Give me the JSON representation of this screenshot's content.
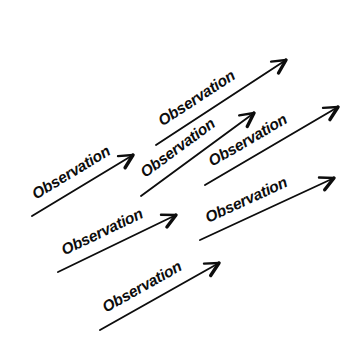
{
  "figure": {
    "background_color": "#ffffff",
    "ink_color": "#0d0d0d",
    "label_text": "Observation",
    "arrow_count": 7,
    "arrow_angle_degrees": -22
  },
  "arrows": [
    {
      "id": "arrow-1",
      "label": "Observation",
      "row": "upper",
      "order": 1,
      "x1": 32,
      "y1": 216,
      "x2": 133,
      "y2": 155,
      "label_font_size": 15.5,
      "label_offset": 12
    },
    {
      "id": "arrow-2",
      "label": "Observation",
      "row": "upper",
      "order": 2,
      "x1": 156,
      "y1": 145,
      "x2": 286,
      "y2": 60,
      "label_font_size": 15.5,
      "label_offset": 12
    },
    {
      "id": "arrow-3",
      "label": "Observation",
      "row": "middle",
      "order": 3,
      "x1": 141,
      "y1": 196,
      "x2": 254,
      "y2": 113,
      "label_font_size": 15.5,
      "label_offset": 12
    },
    {
      "id": "arrow-4",
      "label": "Observation",
      "row": "middle",
      "order": 4,
      "x1": 205,
      "y1": 185,
      "x2": 338,
      "y2": 107,
      "label_font_size": 15.5,
      "label_offset": 12
    },
    {
      "id": "arrow-5",
      "label": "Observation",
      "row": "lower",
      "order": 5,
      "x1": 58,
      "y1": 272,
      "x2": 176,
      "y2": 215,
      "label_font_size": 15.5,
      "label_offset": 12
    },
    {
      "id": "arrow-6",
      "label": "Observation",
      "row": "lower",
      "order": 6,
      "x1": 200,
      "y1": 240,
      "x2": 334,
      "y2": 178,
      "label_font_size": 15.5,
      "label_offset": 12
    },
    {
      "id": "arrow-7",
      "label": "Observation",
      "row": "bottom",
      "order": 7,
      "x1": 100,
      "y1": 330,
      "x2": 219,
      "y2": 263,
      "label_font_size": 15.5,
      "label_offset": 12
    }
  ]
}
